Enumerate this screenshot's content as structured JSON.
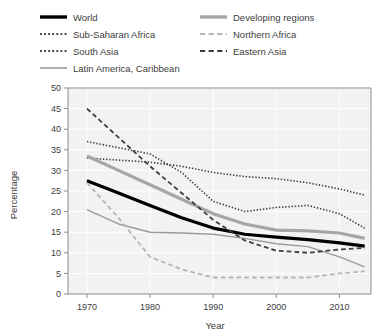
{
  "chart_data": {
    "type": "line",
    "title": "",
    "xlabel": "Year",
    "ylabel": "Percentage",
    "xlim": [
      1967,
      2015
    ],
    "ylim": [
      0,
      50
    ],
    "xticks": [
      1970,
      1980,
      1990,
      2000,
      2010
    ],
    "yticks": [
      0,
      5,
      10,
      15,
      20,
      25,
      30,
      35,
      40,
      45,
      50
    ],
    "grid": true,
    "legend_position": "top",
    "x": [
      1970,
      1975,
      1980,
      1985,
      1990,
      1995,
      2000,
      2005,
      2010,
      2014
    ],
    "series": [
      {
        "name": "World",
        "color": "#000000",
        "style": "solid",
        "width": 3.2,
        "values": [
          27.5,
          24.5,
          21.5,
          18.5,
          16.0,
          14.5,
          13.8,
          13.2,
          12.4,
          11.6
        ]
      },
      {
        "name": "Sub-Saharan Africa",
        "color": "#3d3d3d",
        "style": "dotted",
        "width": 1.6,
        "values": [
          33.0,
          32.5,
          32.0,
          31.0,
          29.5,
          28.5,
          28.0,
          27.0,
          25.5,
          24.0
        ]
      },
      {
        "name": "South Asia",
        "color": "#3d3d3d",
        "style": "dotted",
        "width": 1.6,
        "values": [
          37.0,
          35.5,
          34.0,
          29.5,
          22.5,
          20.0,
          21.0,
          21.5,
          19.5,
          16.0
        ]
      },
      {
        "name": "Latin America, Caribbean",
        "color": "#9a9a9a",
        "style": "solid",
        "width": 1.4,
        "values": [
          20.5,
          17.0,
          15.0,
          14.8,
          14.5,
          13.5,
          12.2,
          11.5,
          9.0,
          6.6
        ]
      },
      {
        "name": "Developing regions",
        "color": "#a6a6a6",
        "style": "solid",
        "width": 3.2,
        "values": [
          33.5,
          30.0,
          26.5,
          23.0,
          19.5,
          17.0,
          15.5,
          15.3,
          14.8,
          13.5
        ]
      },
      {
        "name": "Northern Africa",
        "color": "#b5b5b5",
        "style": "dashed",
        "width": 1.8,
        "values": [
          27.0,
          18.5,
          9.0,
          6.0,
          4.0,
          4.0,
          4.0,
          4.0,
          5.0,
          5.5
        ]
      },
      {
        "name": "Eastern Asia",
        "color": "#3d3d3d",
        "style": "dashed",
        "width": 1.8,
        "values": [
          45.0,
          38.0,
          31.0,
          24.5,
          18.0,
          13.0,
          10.5,
          10.0,
          10.8,
          11.2
        ]
      }
    ],
    "legend": [
      {
        "label": "World",
        "color": "#000000",
        "style": "solid",
        "width": 3.4
      },
      {
        "label": "Developing regions",
        "color": "#a6a6a6",
        "style": "solid",
        "width": 3.4
      },
      {
        "label": "Sub-Saharan Africa",
        "color": "#3d3d3d",
        "style": "dotted",
        "width": 2
      },
      {
        "label": "Northern Africa",
        "color": "#b5b5b5",
        "style": "dashed",
        "width": 2
      },
      {
        "label": "South Asia",
        "color": "#3d3d3d",
        "style": "dotted",
        "width": 2
      },
      {
        "label": "Eastern Asia",
        "color": "#3d3d3d",
        "style": "dashed",
        "width": 2
      },
      {
        "label": "Latin America, Caribbean",
        "color": "#9a9a9a",
        "style": "solid",
        "width": 1.6
      }
    ]
  },
  "axes": {
    "y_title": "Percentage",
    "x_title": "Year",
    "y_tick_labels": [
      "50",
      "45",
      "40",
      "35",
      "30",
      "25",
      "20",
      "15",
      "10",
      "5",
      "0"
    ],
    "x_tick_labels": [
      "1970",
      "1980",
      "1990",
      "2000",
      "2010"
    ]
  },
  "style": {
    "plot_bg": "#f2f2f2",
    "grid_color": "#ffffff",
    "axis_color": "#8c8c8c",
    "text_color": "#3c3c3c",
    "page_bg": "#ffffff"
  }
}
